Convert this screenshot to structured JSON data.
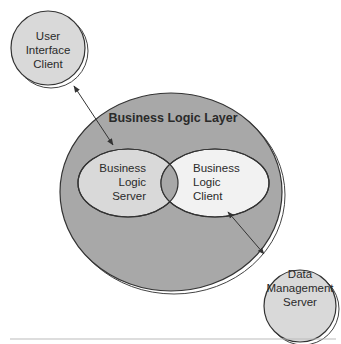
{
  "diagram": {
    "layer_title": "Business Logic Layer",
    "nodes": [
      {
        "id": "user-interface-client",
        "lines": [
          "User",
          "Interface",
          "Client"
        ]
      },
      {
        "id": "business-logic-server",
        "lines": [
          "Business",
          "Logic",
          "Server"
        ]
      },
      {
        "id": "business-logic-client",
        "lines": [
          "Business",
          "Logic",
          "Client"
        ]
      },
      {
        "id": "data-management-server",
        "lines": [
          "Data",
          "Management",
          "Server"
        ]
      }
    ],
    "edges": [
      {
        "from": "user-interface-client",
        "to": "business-logic-server",
        "direction": "bidirectional"
      },
      {
        "from": "business-logic-client",
        "to": "data-management-server",
        "direction": "bidirectional"
      }
    ],
    "colors": {
      "outer_layer": "#a8a8a8",
      "node_fill": "#d9d9d9",
      "client_fill": "#f2f2f2",
      "stroke": "#333333"
    }
  }
}
